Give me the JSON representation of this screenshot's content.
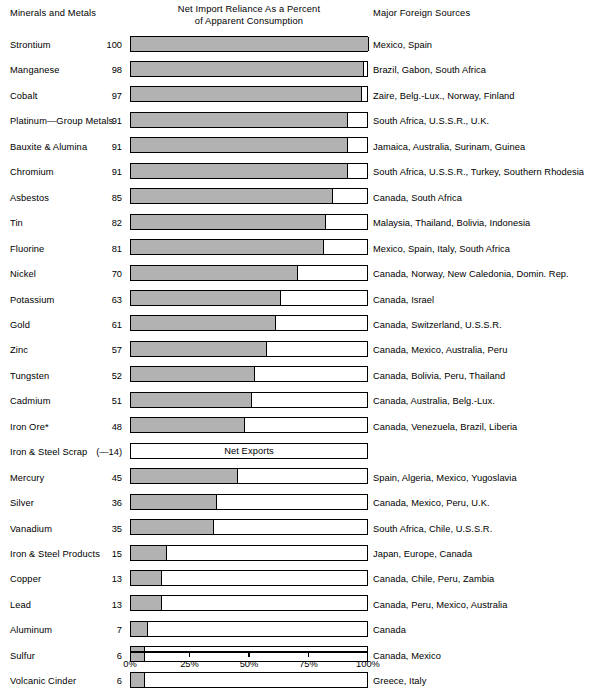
{
  "headers": {
    "left": "Minerals and Metals",
    "center_line1": "Net Import Reliance As a Percent",
    "center_line2": "of Apparent Consumption",
    "right": "Major Foreign Sources"
  },
  "axis": {
    "ticks": [
      "0%",
      "25%",
      "50%",
      "75%",
      "100%"
    ],
    "tick_values": [
      0,
      25,
      50,
      75,
      100
    ]
  },
  "net_exports_note": "Net Exports",
  "colors": {
    "bar_fill": "#b2b2b2",
    "bar_outline": "#000000",
    "background": "#ffffff"
  },
  "chart_data": {
    "type": "bar",
    "orientation": "horizontal",
    "title": "Net Import Reliance As a Percent of Apparent Consumption",
    "xlabel": "",
    "ylabel": "Minerals and Metals",
    "xlim": [
      0,
      100
    ],
    "grid": false,
    "legend": "none",
    "categories": [
      "Strontium",
      "Manganese",
      "Cobalt",
      "Platinum—Group Metals",
      "Bauxite & Alumina",
      "Chromium",
      "Asbestos",
      "Tin",
      "Fluorine",
      "Nickel",
      "Potassium",
      "Gold",
      "Zinc",
      "Tungsten",
      "Cadmium",
      "Iron Ore*",
      "Iron & Steel Scrap",
      "Mercury",
      "Silver",
      "Vanadium",
      "Iron & Steel Products",
      "Copper",
      "Lead",
      "Aluminum",
      "Sulfur",
      "Volcanic Cinder"
    ],
    "values": [
      100,
      98,
      97,
      91,
      91,
      91,
      85,
      82,
      81,
      70,
      63,
      61,
      57,
      52,
      51,
      48,
      -14,
      45,
      36,
      35,
      15,
      13,
      13,
      7,
      6,
      6
    ],
    "value_labels": [
      "100",
      "98",
      "97",
      "91",
      "91",
      "91",
      "85",
      "82",
      "81",
      "70",
      "63",
      "61",
      "57",
      "52",
      "51",
      "48",
      "(—14)",
      "45",
      "36",
      "35",
      "15",
      "13",
      "13",
      "7",
      "6",
      "6"
    ],
    "sources": [
      "Mexico, Spain",
      "Brazil, Gabon, South Africa",
      "Zaire, Belg.-Lux., Norway, Finland",
      "South Africa, U.S.S.R., U.K.",
      "Jamaica, Australia, Surinam, Guinea",
      "South Africa, U.S.S.R., Turkey, Southern Rhodesia",
      "Canada, South Africa",
      "Malaysia, Thailand, Bolivia, Indonesia",
      "Mexico, Spain, Italy, South Africa",
      "Canada, Norway, New Caledonia, Domin. Rep.",
      "Canada, Israel",
      "Canada, Switzerland, U.S.S.R.",
      "Canada, Mexico, Australia, Peru",
      "Canada, Bolivia, Peru, Thailand",
      "Canada, Australia, Belg.-Lux.",
      "Canada, Venezuela, Brazil, Liberia",
      "",
      "Spain, Algeria, Mexico, Yugoslavia",
      "Canada, Mexico, Peru, U.K.",
      "South Africa, Chile, U.S.S.R.",
      "Japan, Europe, Canada",
      "Canada, Chile, Peru, Zambia",
      "Canada, Peru, Mexico, Australia",
      "Canada",
      "Canada, Mexico",
      "Greece, Italy"
    ]
  }
}
